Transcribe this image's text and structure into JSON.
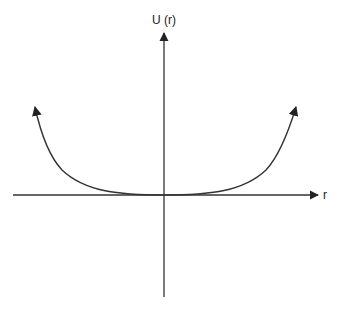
{
  "diagram": {
    "y_axis_label": "U (r)",
    "x_axis_label": "r",
    "curve": "U-shaped potential, minimum at origin, rising on both sides with arrowheads",
    "colors": {
      "axis": "#333333",
      "curve": "#333333",
      "background": "#ffffff"
    }
  }
}
